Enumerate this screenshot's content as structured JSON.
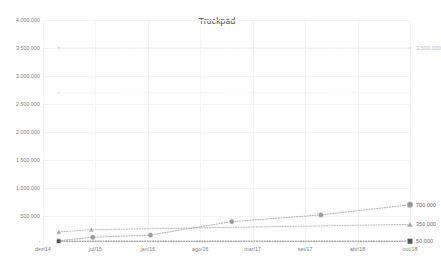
{
  "chart_data": {
    "type": "line",
    "title": "Truckpad",
    "xlabel": "",
    "ylabel": "",
    "grid": true,
    "legend_position": "none",
    "xlim": [
      "dez/14",
      "out/18"
    ],
    "ylim": [
      0,
      4000000
    ],
    "ytick_labels": [
      "4.000.000",
      "3.500.000",
      "3.000.000",
      "2.500.000",
      "2.000.000",
      "1.500.000",
      "1.000.000",
      "500.000"
    ],
    "ytick_values": [
      4000000,
      3500000,
      3000000,
      2500000,
      2000000,
      1500000,
      1000000,
      500000
    ],
    "categories": [
      "dez/14",
      "jul/15",
      "jan/16",
      "ago/16",
      "mar/17",
      "set/17",
      "abr/18",
      "out/18"
    ],
    "series": [
      {
        "name": "series-circle",
        "marker": "circle",
        "color": "#9a9a9a",
        "end_label": "700.000",
        "end_value": 700000,
        "points": [
          {
            "x": 0.3,
            "y": 60000
          },
          {
            "x": 0.95,
            "y": 120000
          },
          {
            "x": 2.05,
            "y": 160000
          },
          {
            "x": 3.6,
            "y": 400000
          },
          {
            "x": 5.3,
            "y": 520000
          },
          {
            "x": 7.0,
            "y": 700000
          }
        ]
      },
      {
        "name": "series-triangle",
        "marker": "triangle",
        "color": "#a5a5a5",
        "end_label": "350.000",
        "end_value": 350000,
        "points": [
          {
            "x": 0.3,
            "y": 215000
          },
          {
            "x": 0.92,
            "y": 255000
          },
          {
            "x": 7.0,
            "y": 350000
          }
        ]
      },
      {
        "name": "series-square",
        "marker": "square",
        "color": "#555555",
        "end_label": "50.000",
        "end_value": 50000,
        "points": [
          {
            "x": 0.3,
            "y": 50000
          },
          {
            "x": 7.0,
            "y": 50000
          }
        ]
      },
      {
        "name": "series-faint-high",
        "marker": "circle",
        "color": "#dcdcdc",
        "end_label": "3.500.000",
        "end_value": 3500000,
        "points": [
          {
            "x": 0.3,
            "y": 3500000
          },
          {
            "x": 7.0,
            "y": 3500000
          }
        ]
      },
      {
        "name": "series-faint-mid",
        "marker": "circle",
        "color": "#e2e2e2",
        "end_label": "",
        "end_value": 2700000,
        "points": [
          {
            "x": 0.3,
            "y": 2700000
          },
          {
            "x": 7.0,
            "y": 2700000
          }
        ]
      }
    ]
  }
}
